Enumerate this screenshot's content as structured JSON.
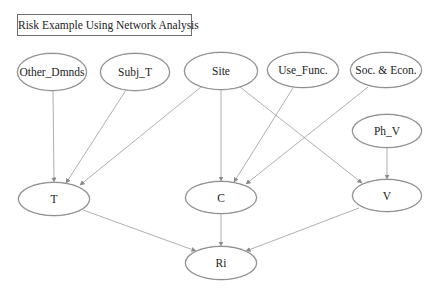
{
  "title": "Risk Example Using Network Analysis",
  "nodes": {
    "other_dmnds": {
      "label": "Other_Dmnds",
      "cx": 52,
      "cy": 72,
      "w": 70,
      "h": 38
    },
    "subj_t": {
      "label": "Subj_T",
      "cx": 135,
      "cy": 72,
      "w": 70,
      "h": 38
    },
    "site": {
      "label": "Site",
      "cx": 221,
      "cy": 71,
      "w": 74,
      "h": 38
    },
    "use_func": {
      "label": "Use_Func.",
      "cx": 303,
      "cy": 70,
      "w": 72,
      "h": 36
    },
    "soc_econ": {
      "label": "Soc. & Econ.",
      "cx": 386,
      "cy": 70,
      "w": 72,
      "h": 36
    },
    "ph_v": {
      "label": "Ph_V",
      "cx": 387,
      "cy": 131,
      "w": 70,
      "h": 34
    },
    "t": {
      "label": "T",
      "cx": 54,
      "cy": 199,
      "w": 72,
      "h": 34
    },
    "c": {
      "label": "C",
      "cx": 221,
      "cy": 198,
      "w": 72,
      "h": 33
    },
    "v": {
      "label": "V",
      "cx": 387,
      "cy": 196,
      "w": 70,
      "h": 33
    },
    "ri": {
      "label": "Ri",
      "cx": 221,
      "cy": 263,
      "w": 72,
      "h": 34
    }
  },
  "edges": [
    {
      "from": "Other_Dmnds",
      "to": "T"
    },
    {
      "from": "Subj_T",
      "to": "T"
    },
    {
      "from": "Site",
      "to": "T"
    },
    {
      "from": "Site",
      "to": "C"
    },
    {
      "from": "Site",
      "to": "V"
    },
    {
      "from": "Use_Func.",
      "to": "C"
    },
    {
      "from": "Soc. & Econ.",
      "to": "C"
    },
    {
      "from": "Ph_V",
      "to": "V"
    },
    {
      "from": "T",
      "to": "Ri"
    },
    {
      "from": "C",
      "to": "Ri"
    },
    {
      "from": "V",
      "to": "Ri"
    }
  ],
  "colors": {
    "edge": "#9a9a9a",
    "node_border": "#8a8a8a",
    "text": "#222222",
    "background": "#ffffff"
  }
}
